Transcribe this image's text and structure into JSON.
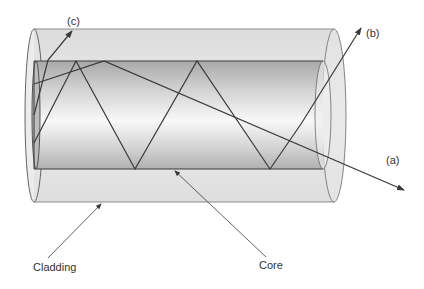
{
  "diagram": {
    "labels": {
      "ray_c": "(c)",
      "ray_b": "(b)",
      "ray_a": "(a)",
      "cladding": "Cladding",
      "core": "Core"
    },
    "colors": {
      "line": "#3a3a3a",
      "cladding_fill": "#e2e2e2",
      "core_dark": "#a9a9a9",
      "core_light": "#f7f7f7"
    }
  }
}
